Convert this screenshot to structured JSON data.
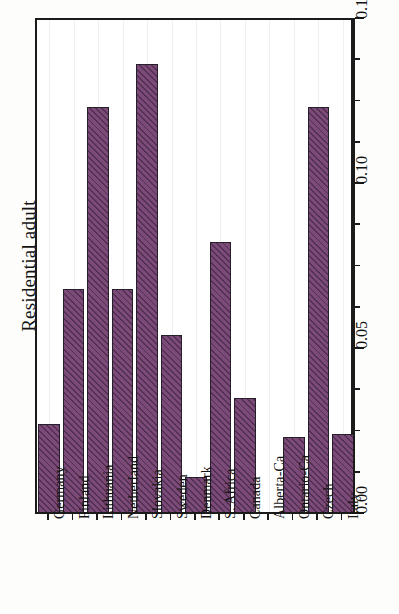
{
  "chart_data": {
    "type": "bar",
    "title": "",
    "subtitle": "",
    "orientation": "vertical-bars-rotated-figure",
    "xlabel": "",
    "ylabel": "Residential adult",
    "ylim": [
      0.0,
      0.15
    ],
    "ytick_labels": [
      "0.00",
      "0.05",
      "0.10",
      "0.15"
    ],
    "ytick_values": [
      0.0,
      0.05,
      0.1,
      0.15
    ],
    "minor_tick_step": 0.0125,
    "grid": false,
    "legend": null,
    "bar_color": "#7c4a79",
    "bar_edge_color": "#241f28",
    "bar_hatch": "diagonal-45",
    "categories": [
      "Germany",
      "Finland",
      "Lithuania",
      "Netherland",
      "Slovakia",
      "Sweden",
      "Denmark",
      "S. Africa",
      "Canada",
      "Alberta-Ca",
      "Ontario-Ca",
      "Czech",
      "Italy"
    ],
    "values": [
      0.027,
      0.068,
      0.123,
      0.068,
      0.136,
      0.054,
      0.011,
      0.082,
      0.035,
      0.0,
      0.023,
      0.123,
      0.024
    ]
  },
  "axis": {
    "title": "Residential adult"
  }
}
